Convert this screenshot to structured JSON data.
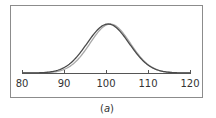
{
  "chart_data": {
    "type": "line",
    "title": "",
    "xlabel": "",
    "ylabel": "",
    "caption_open": "(",
    "caption_letter": "a",
    "caption_close": ")",
    "xlim": [
      80,
      120
    ],
    "ylim": [
      0,
      1
    ],
    "grid": false,
    "legend": "none",
    "xticks": [
      80,
      90,
      100,
      110,
      120
    ],
    "xtick_labels": [
      "80",
      "90",
      "100",
      "110",
      "120"
    ],
    "series": [
      {
        "name": "curve-light",
        "color": "#a8a8a8",
        "distribution": "normal",
        "mean": 101,
        "sd": 4.8,
        "peak": 1.0
      },
      {
        "name": "curve-dark",
        "color": "#4a4a4a",
        "distribution": "normal",
        "mean": 100.5,
        "sd": 5.0,
        "peak": 1.0
      }
    ]
  },
  "colors": {
    "frame": "#8c8c8c",
    "axis": "#555555"
  }
}
